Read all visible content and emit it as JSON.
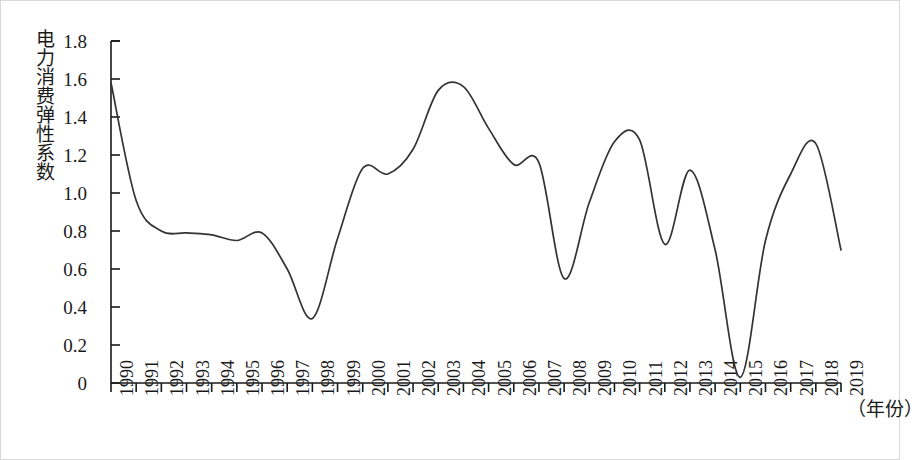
{
  "chart_data": {
    "type": "line",
    "title": "",
    "xlabel": "（年份）",
    "ylabel": "电力消费弹性系数",
    "xlim": [
      1990,
      2019
    ],
    "ylim": [
      0,
      1.8
    ],
    "grid": false,
    "legend": null,
    "x": [
      1990,
      1991,
      1992,
      1993,
      1994,
      1995,
      1996,
      1997,
      1998,
      1999,
      2000,
      2001,
      2002,
      2003,
      2004,
      2005,
      2006,
      2007,
      2008,
      2009,
      2010,
      2011,
      2012,
      2013,
      2014,
      2015,
      2016,
      2017,
      2018,
      2019
    ],
    "x_tick_labels": [
      "1990",
      "1991",
      "1992",
      "1993",
      "1994",
      "1995",
      "1996",
      "1997",
      "1998",
      "1999",
      "2000",
      "2001",
      "2002",
      "2003",
      "2004",
      "2005",
      "2006",
      "2007",
      "2008",
      "2009",
      "2010",
      "2011",
      "2012",
      "2013",
      "2014",
      "2015",
      "2016",
      "2017",
      "2018",
      "2019"
    ],
    "y_tick_labels": [
      "0",
      "0.2",
      "0.4",
      "0.6",
      "0.8",
      "1.0",
      "1.2",
      "1.4",
      "1.6",
      "1.8"
    ],
    "y_ticks": [
      0,
      0.2,
      0.4,
      0.6,
      0.8,
      1.0,
      1.2,
      1.4,
      1.6,
      1.8
    ],
    "series": [
      {
        "name": "电力消费弹性系数",
        "color": "#333333",
        "values": [
          1.58,
          0.96,
          0.8,
          0.79,
          0.78,
          0.75,
          0.79,
          0.6,
          0.34,
          0.76,
          1.13,
          1.1,
          1.23,
          1.54,
          1.56,
          1.34,
          1.15,
          1.16,
          0.55,
          0.95,
          1.27,
          1.28,
          0.73,
          1.12,
          0.7,
          0.03,
          0.75,
          1.1,
          1.26,
          0.7
        ]
      }
    ]
  },
  "axis": {
    "y_title": "电力消费弹性系数",
    "x_caption": "（年份）"
  }
}
